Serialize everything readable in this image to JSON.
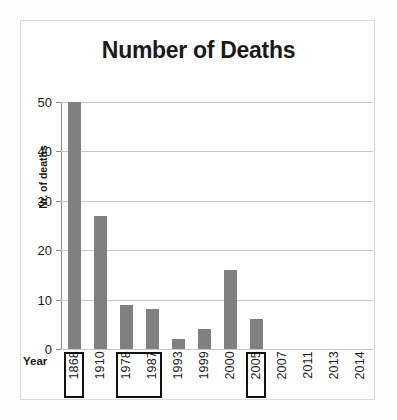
{
  "chart_data": {
    "type": "bar",
    "title": "Number of Deaths",
    "xlabel": "Year",
    "ylabel": "Nr. of deaths",
    "categories": [
      "1868",
      "1910",
      "1978",
      "1987",
      "1993",
      "1999",
      "2000",
      "2005",
      "2007",
      "2011",
      "2013",
      "2014"
    ],
    "values": [
      50,
      27,
      9,
      8,
      2,
      4,
      16,
      6,
      0,
      0,
      0,
      0
    ],
    "ylim": [
      0,
      50
    ],
    "yticks": [
      "0",
      "10",
      "20",
      "30",
      "40",
      "50"
    ],
    "ytick_values": [
      0,
      10,
      20,
      30,
      40,
      50
    ],
    "grid": true,
    "legend": "none",
    "bar_color": "#808080",
    "gridline_color": "#c8c8c8",
    "axis_color": "#8c8c8c",
    "text_color": "#1a1a1a",
    "highlighted_categories": [
      "1868",
      "1978",
      "1987",
      "2005"
    ],
    "highlight_groups": [
      [
        "1868"
      ],
      [
        "1978",
        "1987"
      ],
      [
        "2005"
      ]
    ]
  }
}
